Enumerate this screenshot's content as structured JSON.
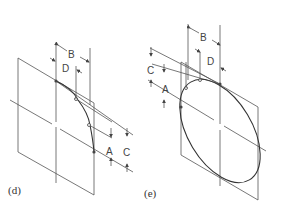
{
  "figure": {
    "panels": [
      {
        "id": "d",
        "caption": "(d)",
        "dimensions": {
          "B": "B",
          "D": "D",
          "A": "A",
          "C": "C"
        },
        "description": "Quarter ellipse arc plotted by offset points on an oblique square"
      },
      {
        "id": "e",
        "caption": "(e)",
        "dimensions": {
          "B": "B",
          "D": "D",
          "A": "A",
          "C": "C"
        },
        "description": "Full ellipse plotted by transferring offset points on an oblique square"
      }
    ]
  }
}
